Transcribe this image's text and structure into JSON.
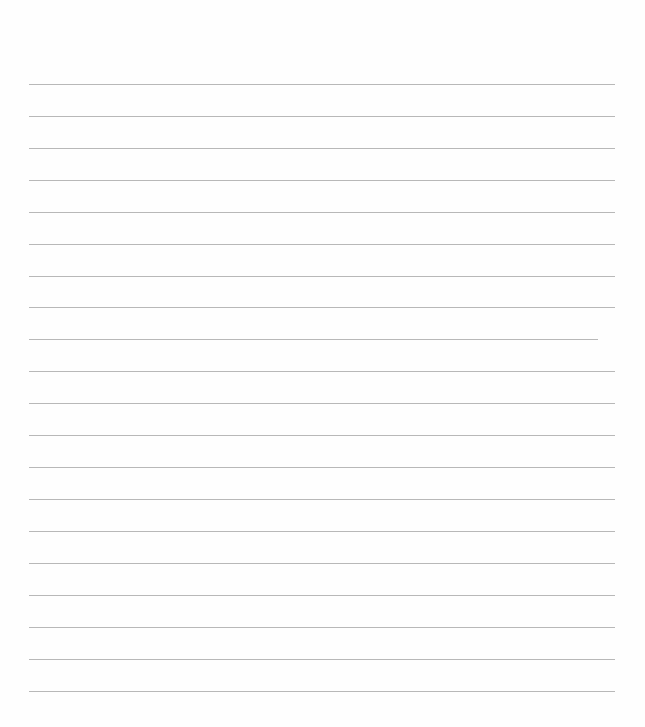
{
  "page": {
    "type": "lined-paper",
    "background": "#fefefe",
    "line_color": "#b8b8b8",
    "line_count": 20,
    "lines": [
      {
        "y": 84,
        "x1": 29,
        "x2": 615
      },
      {
        "y": 116,
        "x1": 29,
        "x2": 615
      },
      {
        "y": 148,
        "x1": 29,
        "x2": 615
      },
      {
        "y": 180,
        "x1": 29,
        "x2": 615
      },
      {
        "y": 212,
        "x1": 29,
        "x2": 615
      },
      {
        "y": 244,
        "x1": 29,
        "x2": 615
      },
      {
        "y": 276,
        "x1": 29,
        "x2": 615
      },
      {
        "y": 307,
        "x1": 29,
        "x2": 615
      },
      {
        "y": 339,
        "x1": 29,
        "x2": 598
      },
      {
        "y": 371,
        "x1": 29,
        "x2": 615
      },
      {
        "y": 403,
        "x1": 29,
        "x2": 615
      },
      {
        "y": 435,
        "x1": 29,
        "x2": 615
      },
      {
        "y": 467,
        "x1": 29,
        "x2": 615
      },
      {
        "y": 499,
        "x1": 29,
        "x2": 615
      },
      {
        "y": 531,
        "x1": 29,
        "x2": 615
      },
      {
        "y": 563,
        "x1": 29,
        "x2": 615
      },
      {
        "y": 595,
        "x1": 29,
        "x2": 615
      },
      {
        "y": 627,
        "x1": 29,
        "x2": 615
      },
      {
        "y": 659,
        "x1": 29,
        "x2": 615
      },
      {
        "y": 691,
        "x1": 29,
        "x2": 615
      }
    ]
  }
}
